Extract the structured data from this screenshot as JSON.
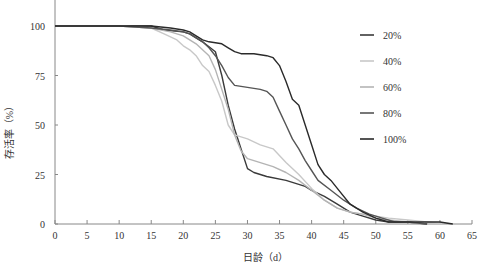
{
  "chart_data": {
    "type": "line",
    "title": "",
    "xlabel": "日龄（d）",
    "ylabel": "存活率（%）",
    "xlim": [
      0,
      65
    ],
    "ylim": [
      0,
      110
    ],
    "xticks": [
      0,
      5,
      10,
      15,
      20,
      25,
      30,
      35,
      40,
      45,
      50,
      55,
      60,
      65
    ],
    "yticks": [
      0,
      25,
      50,
      75,
      100
    ],
    "grid": false,
    "legend_position": "upper right",
    "series": [
      {
        "name": "20%",
        "color": "#3a3a3a",
        "points": [
          [
            0,
            100
          ],
          [
            10,
            100
          ],
          [
            15,
            100
          ],
          [
            17,
            98
          ],
          [
            20,
            97
          ],
          [
            21,
            96
          ],
          [
            23,
            92
          ],
          [
            25,
            87
          ],
          [
            26,
            75
          ],
          [
            27,
            60
          ],
          [
            28,
            48
          ],
          [
            29,
            38
          ],
          [
            30,
            28
          ],
          [
            31,
            26
          ],
          [
            33,
            24
          ],
          [
            36,
            22
          ],
          [
            39,
            19
          ],
          [
            40,
            17
          ],
          [
            42,
            14
          ],
          [
            44,
            10
          ],
          [
            46,
            6
          ],
          [
            48,
            4
          ],
          [
            50,
            2
          ],
          [
            52,
            1
          ],
          [
            55,
            1
          ],
          [
            58,
            0
          ]
        ]
      },
      {
        "name": "40%",
        "color": "#c8c8c8",
        "points": [
          [
            0,
            100
          ],
          [
            10,
            100
          ],
          [
            15,
            99
          ],
          [
            17,
            96
          ],
          [
            19,
            93
          ],
          [
            20,
            90
          ],
          [
            21,
            88
          ],
          [
            22,
            85
          ],
          [
            23,
            80
          ],
          [
            24,
            77
          ],
          [
            25,
            70
          ],
          [
            26,
            62
          ],
          [
            27,
            50
          ],
          [
            28,
            45
          ],
          [
            30,
            43
          ],
          [
            32,
            40
          ],
          [
            34,
            38
          ],
          [
            36,
            31
          ],
          [
            38,
            25
          ],
          [
            40,
            18
          ],
          [
            42,
            12
          ],
          [
            44,
            8
          ],
          [
            46,
            6
          ],
          [
            48,
            5
          ],
          [
            50,
            4
          ],
          [
            52,
            3
          ],
          [
            55,
            2
          ],
          [
            58,
            1
          ],
          [
            61,
            0
          ]
        ]
      },
      {
        "name": "60%",
        "color": "#b4b4b4",
        "points": [
          [
            0,
            100
          ],
          [
            10,
            100
          ],
          [
            15,
            99
          ],
          [
            18,
            97
          ],
          [
            20,
            95
          ],
          [
            22,
            91
          ],
          [
            24,
            85
          ],
          [
            25,
            78
          ],
          [
            26,
            68
          ],
          [
            27,
            58
          ],
          [
            28,
            45
          ],
          [
            29,
            37
          ],
          [
            30,
            33
          ],
          [
            32,
            31
          ],
          [
            34,
            29
          ],
          [
            36,
            26
          ],
          [
            38,
            22
          ],
          [
            40,
            17
          ],
          [
            42,
            12
          ],
          [
            44,
            8
          ],
          [
            46,
            6
          ],
          [
            48,
            5
          ],
          [
            50,
            3
          ],
          [
            52,
            2
          ],
          [
            55,
            1
          ],
          [
            57,
            0
          ]
        ]
      },
      {
        "name": "80%",
        "color": "#555555",
        "points": [
          [
            0,
            100
          ],
          [
            10,
            100
          ],
          [
            15,
            99
          ],
          [
            18,
            98
          ],
          [
            20,
            97
          ],
          [
            21,
            96
          ],
          [
            22,
            94
          ],
          [
            23,
            92
          ],
          [
            24,
            89
          ],
          [
            25,
            85
          ],
          [
            26,
            80
          ],
          [
            27,
            74
          ],
          [
            28,
            70
          ],
          [
            30,
            69
          ],
          [
            32,
            68
          ],
          [
            33,
            67
          ],
          [
            34,
            64
          ],
          [
            35,
            57
          ],
          [
            36,
            50
          ],
          [
            37,
            43
          ],
          [
            38,
            38
          ],
          [
            39,
            32
          ],
          [
            40,
            27
          ],
          [
            41,
            22
          ],
          [
            43,
            17
          ],
          [
            45,
            12
          ],
          [
            47,
            8
          ],
          [
            49,
            5
          ],
          [
            51,
            3
          ],
          [
            53,
            1
          ],
          [
            55,
            1
          ],
          [
            58,
            0
          ]
        ]
      },
      {
        "name": "100%",
        "color": "#2a2a2a",
        "points": [
          [
            0,
            100
          ],
          [
            10,
            100
          ],
          [
            15,
            100
          ],
          [
            18,
            99
          ],
          [
            20,
            98
          ],
          [
            21,
            97
          ],
          [
            22,
            95
          ],
          [
            23,
            93
          ],
          [
            24,
            92
          ],
          [
            26,
            91
          ],
          [
            27,
            89
          ],
          [
            28,
            87
          ],
          [
            29,
            86
          ],
          [
            31,
            86
          ],
          [
            33,
            85
          ],
          [
            34,
            84
          ],
          [
            35,
            80
          ],
          [
            36,
            72
          ],
          [
            37,
            63
          ],
          [
            38,
            60
          ],
          [
            39,
            50
          ],
          [
            40,
            40
          ],
          [
            41,
            30
          ],
          [
            42,
            25
          ],
          [
            43,
            22
          ],
          [
            44,
            18
          ],
          [
            46,
            10
          ],
          [
            48,
            6
          ],
          [
            50,
            3
          ],
          [
            52,
            1
          ],
          [
            55,
            1
          ],
          [
            60,
            1
          ],
          [
            62,
            0
          ]
        ]
      }
    ],
    "legend": [
      "20%",
      "40%",
      "60%",
      "80%",
      "100%"
    ]
  }
}
